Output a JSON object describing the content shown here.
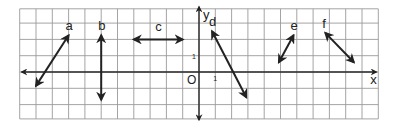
{
  "diagram": {
    "title": "",
    "axes": {
      "x_label": "x",
      "y_label": "y",
      "origin_label": "O",
      "x_unit_label": "1",
      "y_unit_label": "1"
    },
    "grid": {
      "x_range": [
        -11,
        11
      ],
      "y_range": [
        -3,
        4
      ],
      "step": 1
    },
    "segments": [
      {
        "label": "a",
        "from": [
          -10,
          -0.85
        ],
        "to": [
          -8,
          2.25
        ],
        "arrows": "both"
      },
      {
        "label": "b",
        "from": [
          -6,
          2.25
        ],
        "to": [
          -6,
          -1.7
        ],
        "arrows": "both"
      },
      {
        "label": "c",
        "from": [
          -4,
          2
        ],
        "to": [
          -1,
          2
        ],
        "arrows": "both"
      },
      {
        "label": "d",
        "from": [
          0.8,
          2.5
        ],
        "to": [
          2.9,
          -1.55
        ],
        "arrows": "both"
      },
      {
        "label": "e",
        "from": [
          4.9,
          0.6
        ],
        "to": [
          5.8,
          2.25
        ],
        "arrows": "both"
      },
      {
        "label": "f",
        "from": [
          7.75,
          2.4
        ],
        "to": [
          9.5,
          0.6
        ],
        "arrows": "both"
      }
    ],
    "colors": {
      "ink": "#222222",
      "grid": "#9a9a9a",
      "background": "#ffffff"
    }
  }
}
